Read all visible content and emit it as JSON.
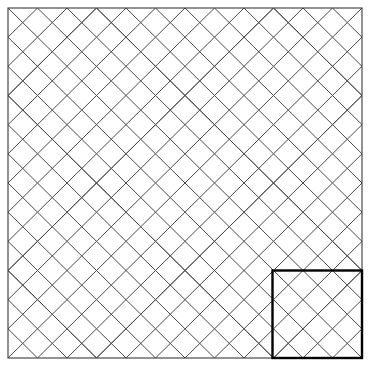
{
  "figure": {
    "kind": "geometric-tiling-diagram",
    "title": "",
    "caption": "",
    "canvas": {
      "width": 369,
      "height": 366,
      "background": "#ffffff"
    }
  },
  "frame": {
    "name": "outer-border",
    "x": 8,
    "y": 8,
    "width": 354,
    "height": 350,
    "stroke": "#3a3a3a",
    "stroke_width": 1.1,
    "fill": "none"
  },
  "grid": {
    "columns": 4,
    "rows": 4,
    "tile_width": 88.5,
    "tile_height": 87.5,
    "origin_x": 8,
    "origin_y": 8,
    "bands_per_tile": 3,
    "band_spacing": 29.5,
    "orientation_rule": "checkerboard-mirror",
    "orientations": [
      [
        "A",
        "B",
        "A",
        "B"
      ],
      [
        "B",
        "A",
        "B",
        "A"
      ],
      [
        "A",
        "B",
        "A",
        "B"
      ],
      [
        "B",
        "A",
        "B",
        "A"
      ]
    ]
  },
  "lines": {
    "stroke": "#4a4a4a",
    "stroke_width": 1.0,
    "fill": "none",
    "linejoin": "miter",
    "linecap": "butt"
  },
  "highlight": {
    "name": "repeat-unit-highlight",
    "label": "",
    "x": 272.5,
    "y": 270.5,
    "width": 89.5,
    "height": 87.5,
    "stroke": "#000000",
    "stroke_width": 2.4,
    "fill": "none",
    "position": "bottom-right-tile"
  },
  "chart_data": {
    "type": "diagram",
    "title": "",
    "xlabel": "",
    "ylabel": "",
    "categories": [],
    "values": []
  }
}
